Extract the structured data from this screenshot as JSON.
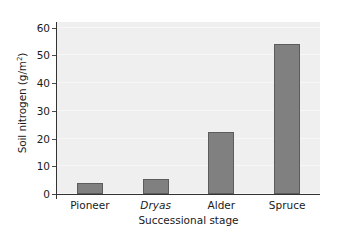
{
  "chart_data": {
    "type": "bar",
    "title": "",
    "xlabel": "Successional stage",
    "ylabel": "Soil nitrogen (g/m",
    "ylabel_sup": "2",
    "ylabel_tail": ")",
    "categories": [
      "Pioneer",
      "Dryas",
      "Alder",
      "Spruce"
    ],
    "categories_italic": [
      false,
      true,
      false,
      false
    ],
    "values": [
      4,
      5.5,
      22.3,
      54
    ],
    "ylim": [
      0,
      62
    ],
    "yticks": [
      0,
      10,
      20,
      30,
      40,
      50,
      60
    ],
    "ytick_labels": [
      "0",
      "10",
      "20",
      "30",
      "40",
      "50",
      "60"
    ],
    "grid": false,
    "legend": "none",
    "bar_color": "#808080",
    "bar_edge_color": "#5c5c5c",
    "plot_background": "#efefef",
    "axis_color": "#333333",
    "figure_background": "#ffffff"
  }
}
